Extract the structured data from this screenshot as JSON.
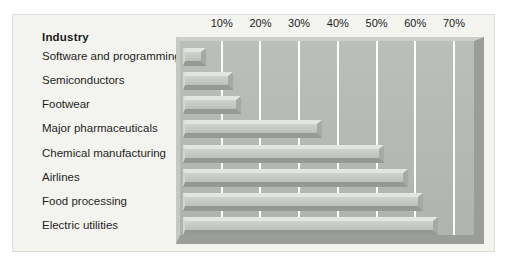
{
  "figure": {
    "legend_header": "Industry"
  },
  "chart_data": {
    "type": "bar",
    "orientation": "horizontal",
    "title": "Industry",
    "categories": [
      "Software and programming",
      "Semiconductors",
      "Footwear",
      "Major pharmaceuticals",
      "Chemical manufacturing",
      "Airlines",
      "Food processing",
      "Electric utilities"
    ],
    "values": [
      6,
      13,
      15,
      36,
      52,
      58,
      62,
      66
    ],
    "value_unit": "%",
    "x_ticks": [
      "10%",
      "20%",
      "30%",
      "40%",
      "50%",
      "60%",
      "70%"
    ],
    "x_tick_values": [
      10,
      20,
      30,
      40,
      50,
      60,
      70
    ],
    "xlim": [
      0,
      75
    ],
    "grid": "vertical white gridlines at each 10%",
    "legend_position": "none",
    "data_labels": "none",
    "style": "3D beveled gray bars on gray plot slab"
  },
  "colors": {
    "page_bg": "#ffffff",
    "panel_bg": "#f3f4ef",
    "panel_border": "#dededa",
    "plot_face": "#b6b8b4",
    "plot_bevel_light": "#cdcfcb",
    "plot_bevel_dark": "#9b9d99",
    "bar_face": "#c6c8c4",
    "bar_bevel_light": "#e3e5e1",
    "bar_bevel_dark": "#969a94",
    "gridline": "#ffffff",
    "text": "#1b1b1b"
  }
}
